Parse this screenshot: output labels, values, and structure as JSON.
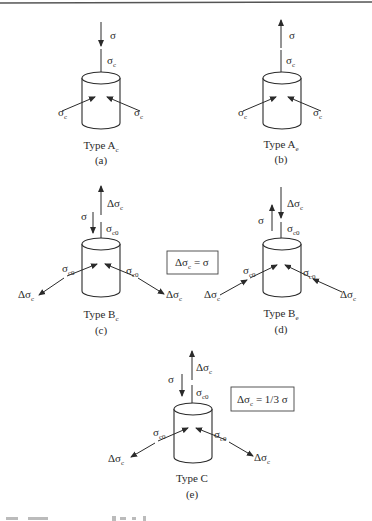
{
  "figure": {
    "symbols": {
      "sigma": "σ",
      "sigma_c": [
        "σ",
        "c"
      ],
      "sigma_c0": [
        "σ",
        "c0"
      ],
      "delta_sigma_c": [
        "Δσ",
        "c"
      ]
    },
    "panels": [
      {
        "id": "a",
        "title_main": "Type A",
        "title_sub": "c",
        "tag": "(a)",
        "axial_label": "σ",
        "axial_direction": "down",
        "confining_label_main": "σ",
        "confining_label_sub": "c",
        "lateral_direction": "inward"
      },
      {
        "id": "b",
        "title_main": "Type A",
        "title_sub": "e",
        "tag": "(b)",
        "axial_label": "σ",
        "axial_direction": "up",
        "confining_label_main": "σ",
        "confining_label_sub": "c",
        "lateral_direction": "inward"
      },
      {
        "id": "c",
        "title_main": "Type B",
        "title_sub": "c",
        "tag": "(c)",
        "axial_label": "σ",
        "delta_label_main": "Δσ",
        "delta_label_sub": "c",
        "confining_label_main": "σ",
        "confining_label_sub": "c0",
        "lateral_direction": "outward"
      },
      {
        "id": "d",
        "title_main": "Type B",
        "title_sub": "e",
        "tag": "(d)",
        "axial_label": "σ",
        "delta_label_main": "Δσ",
        "delta_label_sub": "c",
        "confining_label_main": "σ",
        "confining_label_sub": "c0",
        "lateral_direction": "inward"
      },
      {
        "id": "e",
        "title_main": "Type C",
        "title_sub": "",
        "tag": "(e)",
        "axial_label": "σ",
        "delta_label_main": "Δσ",
        "delta_label_sub": "c",
        "confining_label_main": "σ",
        "confining_label_sub": "c0",
        "lateral_direction": "outward"
      }
    ],
    "equations": [
      {
        "id": "eq-b",
        "lhs_main": "Δσ",
        "lhs_sub": "c",
        "rhs": " = σ"
      },
      {
        "id": "eq-c",
        "lhs_main": "Δσ",
        "lhs_sub": "c",
        "rhs": " = 1/3 σ"
      }
    ]
  }
}
